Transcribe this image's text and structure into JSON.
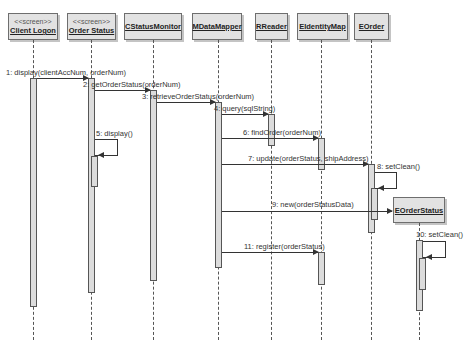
{
  "diagram": {
    "type": "uml-sequence",
    "objects": [
      {
        "id": "client_logon",
        "stereotype": "<<screen>>",
        "name": "Client Logon"
      },
      {
        "id": "order_status",
        "stereotype": "<<screen>>",
        "name": "Order Status"
      },
      {
        "id": "cstatusmonitor",
        "stereotype": "",
        "name": "CStatusMonitor"
      },
      {
        "id": "mdatamapper",
        "stereotype": "",
        "name": "MDataMapper"
      },
      {
        "id": "rreader",
        "stereotype": "",
        "name": "RReader"
      },
      {
        "id": "eidentitymap",
        "stereotype": "",
        "name": "EIdentityMap"
      },
      {
        "id": "eorder",
        "stereotype": "",
        "name": "EOrder"
      },
      {
        "id": "eorderstatus",
        "stereotype": "",
        "name": "EOrderStatus",
        "created": true
      }
    ],
    "messages": [
      {
        "label": "1: display(clientAccNum, orderNum)",
        "from": "actor",
        "to": "client_logon"
      },
      {
        "label": "2: getOrderStatus(orderNum)",
        "from": "client_logon",
        "to": "cstatusmonitor"
      },
      {
        "label": "3: retrieveOrderStatus(orderNum)",
        "from": "cstatusmonitor",
        "to": "mdatamapper"
      },
      {
        "label": "4: query(sqlString)",
        "from": "mdatamapper",
        "to": "rreader"
      },
      {
        "label": "5: display()",
        "from": "order_status",
        "to": "order_status"
      },
      {
        "label": "6: findOrder(orderNum)",
        "from": "mdatamapper",
        "to": "eidentitymap"
      },
      {
        "label": "7: update(orderStatus, shipAddress)",
        "from": "mdatamapper",
        "to": "eorder"
      },
      {
        "label": "8: setClean()",
        "from": "eorder",
        "to": "eorder"
      },
      {
        "label": "9: new(orderStatusData)",
        "from": "mdatamapper",
        "to": "eorderstatus"
      },
      {
        "label": "10: setClean()",
        "from": "eorderstatus",
        "to": "eorderstatus"
      },
      {
        "label": "11: register(orderStatus)",
        "from": "mdatamapper",
        "to": "eidentitymap"
      }
    ]
  }
}
